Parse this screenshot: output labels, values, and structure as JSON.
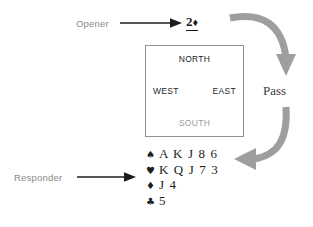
{
  "diagram": {
    "opener": {
      "label": "Opener",
      "arrow_icon": "right-arrow-icon",
      "bid": "2",
      "bid_suit": "♦",
      "bid_full": "2♦"
    },
    "compass": {
      "north": "NORTH",
      "west": "WEST",
      "east": "EAST",
      "south": "SOUTH"
    },
    "pass": {
      "label": "Pass",
      "top_arrow_icon": "curved-arrow-down-icon",
      "bottom_arrow_icon": "curved-arrow-left-icon"
    },
    "responder": {
      "label": "Responder",
      "arrow_icon": "right-arrow-icon"
    },
    "hand": [
      {
        "suit_symbol": "♠",
        "suit_name": "spades",
        "cards": "A K J 8 6"
      },
      {
        "suit_symbol": "♥",
        "suit_name": "hearts",
        "cards": "K Q J 7 3"
      },
      {
        "suit_symbol": "♦",
        "suit_name": "diamonds",
        "cards": "J 4"
      },
      {
        "suit_symbol": "♣",
        "suit_name": "clubs",
        "cards": "5"
      }
    ],
    "colors": {
      "text_dark": "#1c1c1c",
      "text_gray": "#8a8a8a",
      "arrow_gray": "#9e9e9e",
      "box_border": "#8f8f8f",
      "background": "#ffffff"
    }
  }
}
